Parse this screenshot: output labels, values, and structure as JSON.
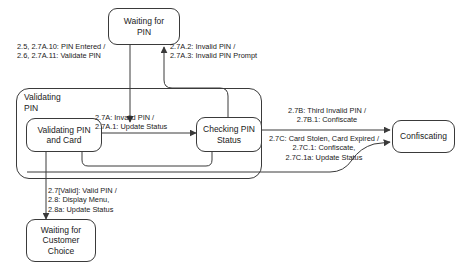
{
  "diagram": {
    "type": "uml-state-machine",
    "composite_state": {
      "name": "Validating\nPIN",
      "substates": [
        {
          "id": "validating-pin-and-card",
          "label": "Validating PIN\nand Card"
        },
        {
          "id": "checking-pin-status",
          "label": "Checking PIN\nStatus"
        }
      ]
    },
    "states": [
      {
        "id": "waiting-for-pin",
        "label": "Waiting for\nPIN"
      },
      {
        "id": "waiting-for-customer-choice",
        "label": "Waiting for\nCustomer\nChoice"
      },
      {
        "id": "confiscating",
        "label": "Confiscating"
      }
    ],
    "transitions": [
      {
        "id": "pin-entered",
        "from": "waiting-for-pin",
        "to": "validating-pin-and-card",
        "label": "2.5, 2.7A.10: PIN Entered /\n2.6, 2.7A.11: Validate PIN"
      },
      {
        "id": "invalid-pin-prompt",
        "from": "checking-pin-status",
        "to": "waiting-for-pin",
        "label": "2.7A.2: Invalid PIN /\n2.7A.3: Invalid PIN Prompt"
      },
      {
        "id": "invalid-pin-update-status",
        "from": "validating-pin-and-card",
        "to": "checking-pin-status",
        "label": "2.7A: Invalid PIN /\n2.7A.1: Update Status"
      },
      {
        "id": "third-invalid-pin",
        "from": "checking-pin-status",
        "to": "confiscating",
        "label": "2.7B: Third Invalid PIN /\n2.7B.1: Confiscate"
      },
      {
        "id": "card-stolen-expired",
        "from": "checking-pin-status",
        "to": "confiscating",
        "label": "2.7C: Card Stolen, Card Expired /\n2.7C.1: Confiscate,\n2.7C.1a: Update Status"
      },
      {
        "id": "valid-pin",
        "from": "validating-pin-and-card",
        "to": "waiting-for-customer-choice",
        "label": "2.7[Valid]: Valid PIN /\n2.8: Display Menu,\n2.8a: Update Status"
      }
    ],
    "caption": ""
  },
  "colors": {
    "stroke": "#3a3a3a",
    "text": "#1a1a1a",
    "background": "#ffffff"
  }
}
